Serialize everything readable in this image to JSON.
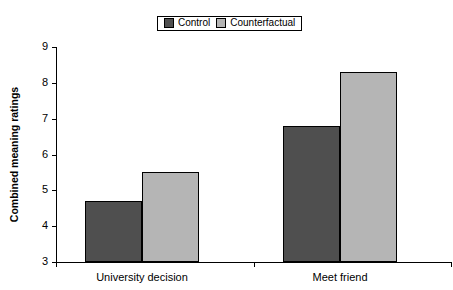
{
  "chart_data": {
    "type": "bar",
    "title": "",
    "xlabel": "",
    "ylabel": "Combined meaning ratings",
    "categories": [
      "University decision",
      "Meet friend"
    ],
    "series": [
      {
        "name": "Control",
        "color": "#4f4f4f",
        "values": [
          4.7,
          6.8
        ]
      },
      {
        "name": "Counterfactual",
        "color": "#b5b5b5",
        "values": [
          5.5,
          8.3
        ]
      }
    ],
    "ylim": [
      3,
      9
    ],
    "yticks": [
      3,
      4,
      5,
      6,
      7,
      8,
      9
    ],
    "ytick_labels": [
      "3",
      "4",
      "5",
      "6",
      "7",
      "8",
      "9"
    ],
    "grid": false,
    "legend_position": "top-center"
  },
  "legend": {
    "entries": [
      {
        "label": "Control",
        "swatch": "#4f4f4f"
      },
      {
        "label": "Counterfactual",
        "swatch": "#b5b5b5"
      }
    ]
  }
}
